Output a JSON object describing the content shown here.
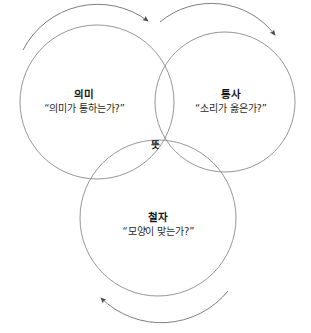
{
  "figure": {
    "type": "venn-diagram-3-circle",
    "background_color": "#ffffff",
    "stroke_color": "#8a8a8a",
    "shaded_fill_color": "#b8b8b8",
    "arrow_color": "#6f6f6f",
    "text_color": "#1a1a1a"
  },
  "circles": {
    "meaning": {
      "title": "의미",
      "question": "“의미가 통하는가?”"
    },
    "syntax": {
      "title": "통사",
      "question": "“소리가 옳은가?”"
    },
    "spelling": {
      "title": "철자",
      "question": "“모양이 맞는가?”"
    }
  },
  "intersection": {
    "label": "뜻"
  },
  "arrows": [
    {
      "name": "arrow-top-left",
      "direction": "clockwise"
    },
    {
      "name": "arrow-top-right",
      "direction": "clockwise"
    },
    {
      "name": "arrow-bottom",
      "direction": "clockwise"
    }
  ]
}
